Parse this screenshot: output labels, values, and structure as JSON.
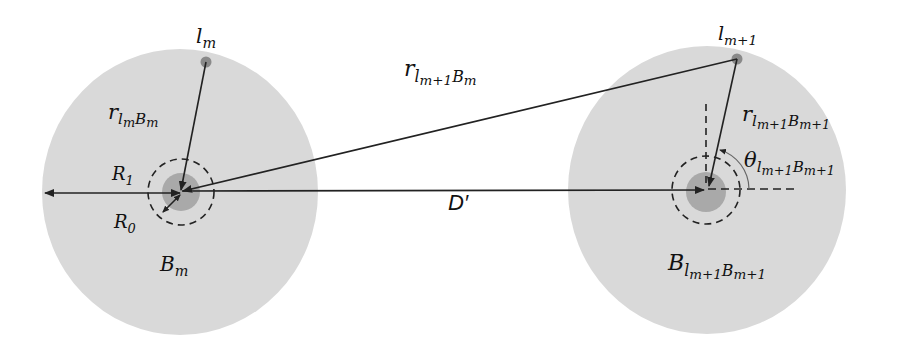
{
  "figure": {
    "type": "geometry-diagram",
    "colors": {
      "background": "#ffffff",
      "cell_fill": "#d9d9d9",
      "inner_zone_fill": "#a9a9a9",
      "user_point": "#8a8a8a",
      "line": "#222222"
    },
    "cells": [
      {
        "id": "left",
        "center": [
          180,
          192
        ],
        "rx": 138,
        "ry": 143,
        "inner_radius": 19,
        "dashed_radius": 33,
        "user_point": [
          206,
          62
        ],
        "label_user": {
          "base": "l",
          "sub": "m"
        },
        "label_cell": {
          "base": "B",
          "sub": "m"
        },
        "label_distance": {
          "base": "r",
          "sub": "l",
          "subsub": "m",
          "tail": "B",
          "tailsub": "m"
        },
        "label_R1": {
          "base": "R",
          "sub": "1"
        },
        "label_R0": {
          "base": "R",
          "sub": "0"
        }
      },
      {
        "id": "right",
        "center": [
          707,
          190
        ],
        "rx": 139,
        "ry": 144,
        "inner_radius": 19,
        "dashed_radius": 33,
        "user_point": [
          737,
          59
        ],
        "label_user": {
          "base": "l",
          "sub": "m+1"
        },
        "label_cell": {
          "base": "B",
          "sub": "l",
          "subsub": "m+1",
          "tail": "B",
          "tailsub": "m+1"
        },
        "label_distance": {
          "base": "r",
          "sub": "l",
          "subsub": "m+1",
          "tail": "B",
          "tailsub": "m+1"
        },
        "label_angle": {
          "base": "θ",
          "sub": "l",
          "subsub": "m+1",
          "tail": "B",
          "tailsub": "m+1"
        }
      }
    ],
    "cross_distance_label": {
      "base": "r",
      "sub": "l",
      "subsub": "m+1",
      "tail": "B",
      "tailsub": "m"
    },
    "separation_label": "D′"
  }
}
